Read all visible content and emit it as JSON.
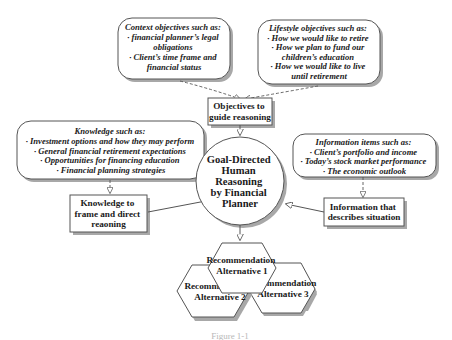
{
  "diagram": {
    "center": {
      "lines": [
        "Goal-Directed",
        "Human",
        "Reasoning",
        "by Financial",
        "Planner"
      ]
    },
    "callouts": {
      "context": {
        "lines": [
          "Context objectives such as:",
          "· financial planner’s legal",
          "obligations",
          "· Client’s time frame and",
          "financial status"
        ]
      },
      "lifestyle": {
        "lines": [
          "Lifestyle objectives such as:",
          "· How we would like to retire",
          "· How we plan to fund our",
          "children’s education",
          "· How we would like to live",
          "until retirement"
        ]
      },
      "knowledge": {
        "lines": [
          "Knowledge such as:",
          "· Investment options and how they may perform",
          "· General financial retirement expectations",
          "· Opportunities for financing education",
          "· Financial planning strategies"
        ]
      },
      "information": {
        "lines": [
          "Information items such as:",
          "· Client’s portfolio and income",
          "· Today’s stock market performance",
          "· The economic outlook"
        ]
      }
    },
    "boxes": {
      "objectives": {
        "lines": [
          "Objectives to",
          "guide reasoning"
        ]
      },
      "knowledge": {
        "lines": [
          "Knowledge to",
          "frame and direct",
          "reaoning"
        ]
      },
      "information": {
        "lines": [
          "Information that",
          "describes situation"
        ]
      }
    },
    "hexagons": {
      "alt1": {
        "lines": [
          "Recommendation",
          "Alternative 1"
        ]
      },
      "alt2": {
        "lines": [
          "Recommendation",
          "Alternative 2"
        ]
      },
      "alt3": {
        "lines": [
          "Recommendation",
          "Alternative 3"
        ]
      }
    },
    "caption": "Figure 1-1",
    "colors": {
      "stroke": "#555555",
      "shadow": "#a8a8a8",
      "fill": "#ffffff",
      "text": "#1a1a1a"
    }
  }
}
